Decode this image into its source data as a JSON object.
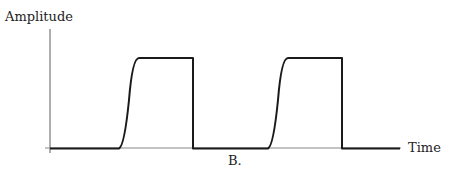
{
  "diagram": {
    "y_axis_label": "Amplitude",
    "x_axis_label": "Time",
    "caption": "B.",
    "waveform": "pulse-train",
    "pulses": [
      {
        "rise_start_x": 120,
        "top_start_x": 138,
        "fall_x": 193
      },
      {
        "rise_start_x": 269,
        "top_start_x": 286,
        "fall_x": 342
      }
    ],
    "colors": {
      "axis": "#777777",
      "signal": "#1a1a1a",
      "text": "#222222"
    }
  }
}
